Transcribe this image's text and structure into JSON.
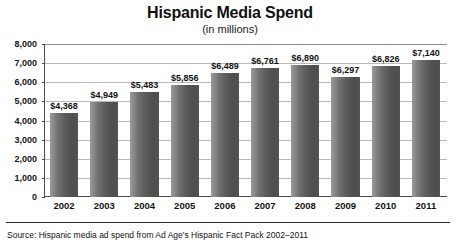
{
  "chart_data": {
    "type": "bar",
    "title": "Hispanic Media Spend",
    "subtitle": "(in millions)",
    "xlabel": "",
    "ylabel": "",
    "ylim": [
      0,
      8000
    ],
    "ytick_step": 1000,
    "grid": true,
    "legend": "none",
    "categories": [
      "2002",
      "2003",
      "2004",
      "2005",
      "2006",
      "2007",
      "2008",
      "2009",
      "2010",
      "2011"
    ],
    "values": [
      4368,
      4949,
      5483,
      5856,
      6489,
      6761,
      6890,
      6297,
      6826,
      7140
    ],
    "value_labels": [
      "$4,368",
      "$4,949",
      "$5,483",
      "$5,856",
      "$6,489",
      "$6,761",
      "$6,890",
      "$6,297",
      "$6,826",
      "$7,140"
    ],
    "ytick_labels": [
      "8,000",
      "7,000",
      "6,000",
      "5,000",
      "4,000",
      "3,000",
      "2,000",
      "1,000",
      "0"
    ],
    "ytick_values": [
      8000,
      7000,
      6000,
      5000,
      4000,
      3000,
      2000,
      1000,
      0
    ],
    "bar_color": "#5d5d5d",
    "grid_color": "#b9b9b9",
    "axis_color": "#4a4a4a"
  },
  "footer": {
    "source": "Source: Hispanic media ad spend from Ad Age's Hispanic Fact Pack 2002–2011"
  }
}
